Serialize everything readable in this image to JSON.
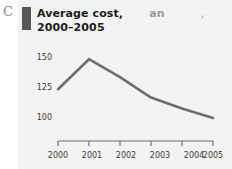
{
  "figure": {
    "panel_letter": "C",
    "background_color": "#f3f3f3",
    "accent_bar_color": "#575757",
    "line_color": "#6e6e6e",
    "axis_color": "#6e6e6e",
    "text_color": "#1c1c1c"
  },
  "title": {
    "line1_main": "Average cost,",
    "line1_faded": "an",
    "line1_faint": ",",
    "line2": "2000–2005"
  },
  "chart_data": {
    "type": "line",
    "xlabel": "",
    "ylabel": "",
    "categories": [
      "2000",
      "2001",
      "2002",
      "2003",
      "2004",
      "2005"
    ],
    "x": [
      2000,
      2001,
      2002,
      2003,
      2004,
      2005
    ],
    "values": [
      124,
      149,
      134,
      117,
      108,
      100
    ],
    "series": [
      {
        "name": "Average cost",
        "values": [
          124,
          149,
          134,
          117,
          108,
          100
        ]
      }
    ],
    "ylim": [
      88,
      158
    ],
    "xlim": [
      2000,
      2005
    ],
    "ytick_labels": [
      "150",
      "125",
      "100"
    ],
    "ytick_values": [
      150,
      125,
      100
    ],
    "xtick_labels": [
      "2000",
      "2001",
      "2002",
      "2003",
      "2004",
      "2005"
    ],
    "grid": false,
    "legend": false,
    "legend_position": "none"
  }
}
